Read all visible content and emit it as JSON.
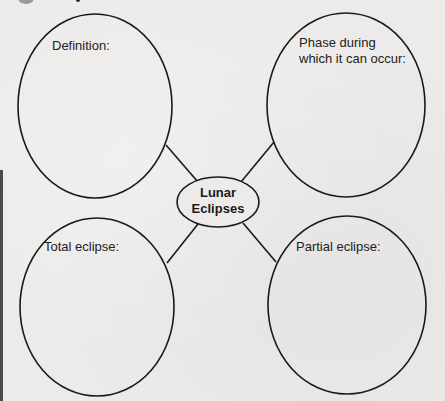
{
  "diagram": {
    "type": "concept-map",
    "center": {
      "line1": "Lunar",
      "line2": "Eclipses"
    },
    "nodes": [
      {
        "id": "definition",
        "label_line1": "Definition:",
        "label_line2": ""
      },
      {
        "id": "phase",
        "label_line1": "Phase during",
        "label_line2": "which it can occur:"
      },
      {
        "id": "total",
        "label_line1": "Total eclipse:",
        "label_line2": ""
      },
      {
        "id": "partial",
        "label_line1": "Partial eclipse:",
        "label_line2": ""
      }
    ],
    "colors": {
      "stroke": "#1a1a1a",
      "background": "#ecebea",
      "text": "#222222"
    }
  }
}
